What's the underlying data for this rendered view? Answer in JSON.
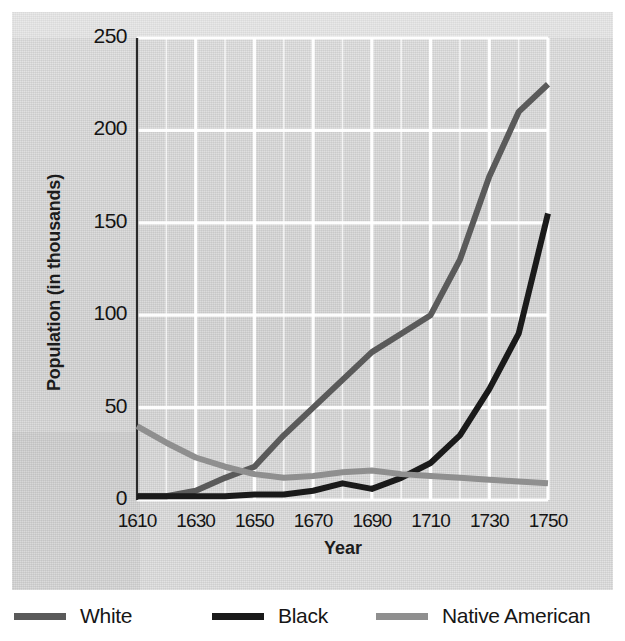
{
  "chart_data": {
    "type": "line",
    "title": "",
    "xlabel": "Year",
    "ylabel": "Population (in thousands)",
    "xlim": [
      1610,
      1750
    ],
    "ylim": [
      0,
      250
    ],
    "xticks": [
      1610,
      1630,
      1650,
      1670,
      1690,
      1710,
      1730,
      1750
    ],
    "xtick_labels": [
      "1610",
      "1630",
      "1650",
      "1670",
      "1690",
      "1710",
      "1730",
      "1750"
    ],
    "yticks": [
      0,
      50,
      100,
      150,
      200,
      250
    ],
    "ytick_labels": [
      "0",
      "50",
      "100",
      "150",
      "200",
      "250"
    ],
    "grid": "white gridlines, vertical every 10 years, horizontal at each y tick",
    "legend_position": "below plot, horizontal",
    "x": [
      1610,
      1620,
      1630,
      1640,
      1650,
      1660,
      1670,
      1680,
      1690,
      1700,
      1710,
      1720,
      1730,
      1740,
      1750
    ],
    "series": [
      {
        "name": "White",
        "color": "#5a5a5a",
        "values": [
          2,
          2,
          5,
          12,
          18,
          35,
          50,
          65,
          80,
          90,
          100,
          130,
          175,
          210,
          225
        ]
      },
      {
        "name": "Black",
        "color": "#1a1a1a",
        "values": [
          2,
          2,
          2,
          2,
          3,
          3,
          5,
          9,
          6,
          12,
          20,
          35,
          60,
          90,
          155
        ]
      },
      {
        "name": "Native American",
        "color": "#8f8f8f",
        "values": [
          40,
          31,
          23,
          18,
          14,
          12,
          13,
          15,
          16,
          14,
          13,
          12,
          11,
          10,
          9
        ]
      }
    ]
  },
  "axes": {
    "y_title": "Population (in thousands)",
    "x_title": "Year"
  },
  "legend": {
    "items": [
      {
        "label": "White",
        "color": "#5a5a5a"
      },
      {
        "label": "Black",
        "color": "#1a1a1a"
      },
      {
        "label": "Native American",
        "color": "#8f8f8f"
      }
    ]
  },
  "colors": {
    "page_background": "#ffffff",
    "panel_background": "#d6d6d6",
    "gridline": "#ffffff",
    "axis_text": "#141414",
    "white_series": "#5a5a5a",
    "black_series": "#1a1a1a",
    "native_american_series": "#8f8f8f"
  }
}
